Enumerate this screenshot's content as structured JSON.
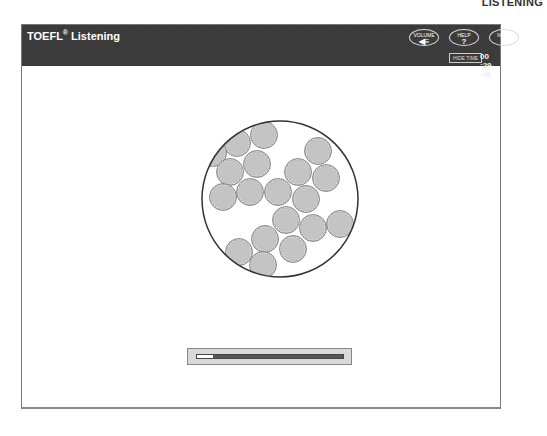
{
  "section_label": "LISTENING",
  "header": {
    "title": "TOEFL",
    "title_mark": "®",
    "title_suffix": " Listening",
    "buttons": {
      "volume": {
        "label": "VOLUME",
        "icon": "speaker-icon",
        "glyph": "◀≡"
      },
      "help": {
        "label": "HELP",
        "icon": "question-icon",
        "glyph": "?"
      },
      "next": {
        "label": "NEXT",
        "icon": "arrow-right-icon",
        "glyph": "➜"
      }
    },
    "hide_time_label": "HIDE TIME",
    "timer": "00 :29 :46"
  },
  "figure": {
    "container": {
      "cx": 258,
      "cy": 174,
      "r": 78
    },
    "particle_radius": 13.5,
    "particles": [
      [
        242,
        110
      ],
      [
        215,
        118
      ],
      [
        191,
        128
      ],
      [
        235,
        139
      ],
      [
        208,
        147
      ],
      [
        296,
        126
      ],
      [
        276,
        147
      ],
      [
        304,
        153
      ],
      [
        201,
        172
      ],
      [
        228,
        167
      ],
      [
        256,
        167
      ],
      [
        284,
        174
      ],
      [
        264,
        195
      ],
      [
        291,
        203
      ],
      [
        318,
        199
      ],
      [
        243,
        214
      ],
      [
        271,
        224
      ],
      [
        217,
        227
      ],
      [
        241,
        240
      ]
    ]
  },
  "progress": {
    "percent": 11
  }
}
